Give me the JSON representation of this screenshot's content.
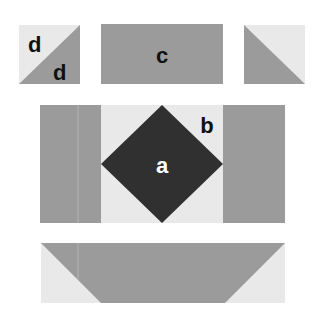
{
  "colors": {
    "light": "#e9e9e9",
    "mid": "#9b9b9b",
    "dark": "#303030",
    "label_dark": "#111111",
    "label_light": "#ffffff"
  },
  "pieces": {
    "half_square_left": {
      "labels": [
        "d",
        "d"
      ]
    },
    "rectangle": {
      "label": "c"
    },
    "half_square_right": {
      "label": ""
    },
    "center_square": {
      "diamond_label": "a",
      "corner_label": "b"
    },
    "flying_geese": {
      "label": ""
    }
  }
}
